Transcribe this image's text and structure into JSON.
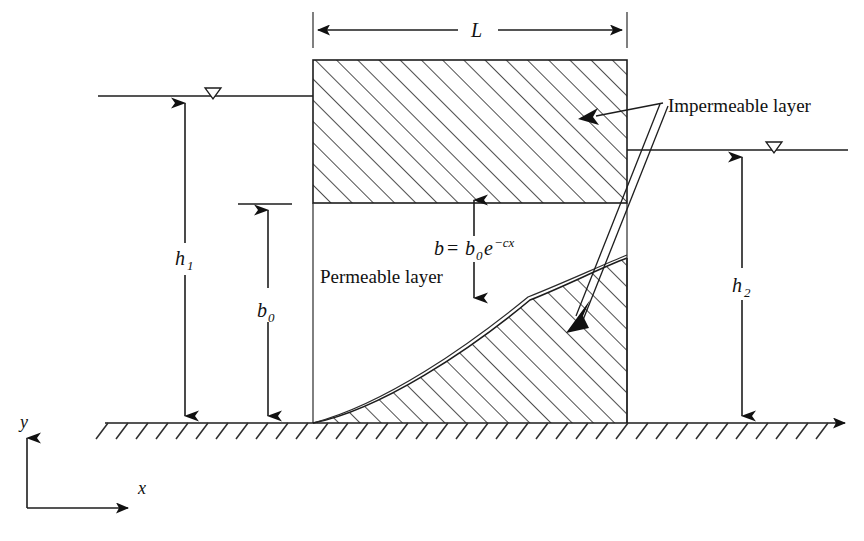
{
  "figure": {
    "type": "engineering-schematic",
    "width": 864,
    "height": 541
  },
  "labels": {
    "length_L": "L",
    "head_left": "h",
    "head_left_sub": "1",
    "head_right": "h",
    "head_right_sub": "2",
    "b_zero": "b",
    "b_zero_sub": "0",
    "thickness_eq_b": "b",
    "thickness_eq_equals": "=",
    "thickness_eq_b0": "b",
    "thickness_eq_b0_sub": "0",
    "thickness_eq_e": "e",
    "thickness_eq_exp": "−cx",
    "impermeable_layer": "Impermeable layer",
    "permeable_layer": "Permeable layer",
    "axis_x": "x",
    "axis_y": "y"
  },
  "annotations": {
    "water_table_symbol": "inverted-open-triangle",
    "hatch_angle_block_deg": 45,
    "hatch_angle_ground_deg": -45
  },
  "geometry": {
    "block_left_x": 313,
    "block_right_x": 627,
    "block_top_y": 60,
    "impermeable_bottom_y": 203,
    "ground_y": 423,
    "water_left_y": 96,
    "water_right_y": 150,
    "dim_L_y": 30,
    "curve_start": [
      313,
      423
    ],
    "curve_end": [
      627,
      258
    ]
  },
  "colors": {
    "background": "#ffffff",
    "ink": "#1d1d1d",
    "hatch": "#2f2f2f"
  }
}
